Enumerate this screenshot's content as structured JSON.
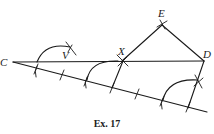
{
  "figure": {
    "caption": "Ex. 17",
    "points": {
      "C": {
        "label": "C",
        "x": 13,
        "y": 62
      },
      "D": {
        "label": "D",
        "x": 204,
        "y": 61
      },
      "E": {
        "label": "E",
        "x": 162,
        "y": 24
      },
      "X": {
        "label": "X",
        "x": 122,
        "y": 61
      },
      "V": {
        "label": "V",
        "x": 64,
        "y": 56
      }
    },
    "segments": [
      {
        "from": "C",
        "to": "D"
      },
      {
        "from": "X",
        "to": "E"
      },
      {
        "from": "E",
        "to": "D"
      },
      {
        "from": "C",
        "to": "lower_end"
      }
    ],
    "lower_line_end": {
      "x": 207,
      "y": 112
    },
    "equal_divisions_on_lower_line": 7,
    "colors": {
      "ink": "#1a1a1a",
      "background": "#ffffff"
    }
  }
}
